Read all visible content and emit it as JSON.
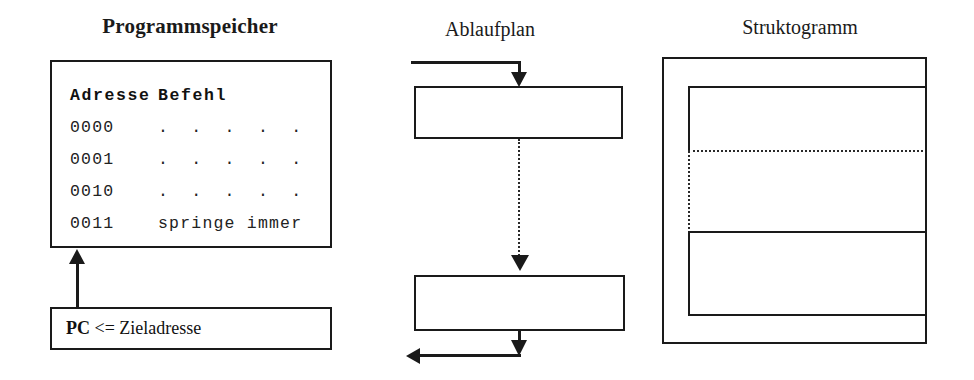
{
  "panels": {
    "memory": {
      "title": "Programmspeicher",
      "header": {
        "address": "Adresse",
        "instruction": "Befehl"
      },
      "rows": [
        {
          "address": "0000",
          "instruction": ".  .  .  .  ."
        },
        {
          "address": "0001",
          "instruction": ".  .  .  .  ."
        },
        {
          "address": "0010",
          "instruction": ".  .  .  .  ."
        },
        {
          "address": "0011",
          "instruction": "springe immer"
        }
      ],
      "pc_box": {
        "register": "PC",
        "assignment": "<= Zieladresse"
      }
    },
    "flowchart": {
      "title": "Ablaufplan",
      "boxes": [
        {
          "label": ""
        },
        {
          "label": ""
        }
      ],
      "connectors": [
        {
          "name": "top-reentry",
          "style": "solid",
          "arrow": "down"
        },
        {
          "name": "between-boxes",
          "style": "dotted",
          "arrow": "down"
        },
        {
          "name": "bottom-exit",
          "style": "solid",
          "arrow": "down"
        },
        {
          "name": "bottom-loopback",
          "style": "solid",
          "arrow": "left"
        }
      ]
    },
    "structogram": {
      "title": "Struktogramm",
      "blocks": [
        {
          "label": "",
          "border": "solid"
        },
        {
          "label": "",
          "border": "dotted"
        },
        {
          "label": "",
          "border": "solid"
        }
      ]
    }
  },
  "colors": {
    "ink": "#1a1a1a",
    "dotted": "#2a2a2a",
    "background": "#ffffff"
  }
}
